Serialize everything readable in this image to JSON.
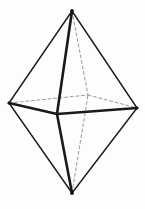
{
  "figure": {
    "kind": "line-drawing",
    "background_color": "#fdfdfc",
    "visible_edge_color": "#1a1a1a",
    "hidden_edge_color": "#9a9a9a",
    "canvas": {
      "width": 145,
      "height": 209
    },
    "vertices": [
      {
        "id": "top-apex",
        "label": "top apex",
        "x": 72,
        "y": 11,
        "hidden": false
      },
      {
        "id": "bottom-apex",
        "label": "bottom apex",
        "x": 72,
        "y": 193,
        "hidden": false
      },
      {
        "id": "left",
        "label": "left equator vertex",
        "x": 9,
        "y": 103,
        "hidden": false
      },
      {
        "id": "right",
        "label": "right equator vertex",
        "x": 137,
        "y": 108,
        "hidden": false
      },
      {
        "id": "front",
        "label": "front equator vertex",
        "x": 57,
        "y": 114,
        "hidden": false
      },
      {
        "id": "back",
        "label": "back equator vertex",
        "x": 88,
        "y": 95,
        "hidden": true
      }
    ],
    "edges": [
      {
        "id": "top-left",
        "from": "top-apex",
        "to": "left",
        "style": "solid",
        "weight": 1.4
      },
      {
        "id": "top-right",
        "from": "top-apex",
        "to": "right",
        "style": "solid",
        "weight": 1.4
      },
      {
        "id": "top-front",
        "from": "top-apex",
        "to": "front",
        "style": "solid",
        "weight": 2.6
      },
      {
        "id": "top-back",
        "from": "top-apex",
        "to": "back",
        "style": "dashed",
        "weight": 1.0
      },
      {
        "id": "bottom-left",
        "from": "bottom-apex",
        "to": "left",
        "style": "solid",
        "weight": 1.4
      },
      {
        "id": "bottom-right",
        "from": "bottom-apex",
        "to": "right",
        "style": "solid",
        "weight": 1.4
      },
      {
        "id": "bottom-front",
        "from": "bottom-apex",
        "to": "front",
        "style": "solid",
        "weight": 2.6
      },
      {
        "id": "bottom-back",
        "from": "bottom-apex",
        "to": "back",
        "style": "dashed",
        "weight": 1.0
      },
      {
        "id": "equator-left-front",
        "from": "left",
        "to": "front",
        "style": "solid",
        "weight": 2.4
      },
      {
        "id": "equator-front-right",
        "from": "front",
        "to": "right",
        "style": "solid",
        "weight": 2.4
      },
      {
        "id": "equator-left-back",
        "from": "left",
        "to": "back",
        "style": "dashed",
        "weight": 1.0
      },
      {
        "id": "equator-back-right",
        "from": "back",
        "to": "right",
        "style": "dashed",
        "weight": 1.0
      }
    ],
    "vertex_markers": [
      {
        "id": "marker-top-apex",
        "x": 72,
        "y": 11,
        "r": 1.9
      },
      {
        "id": "marker-bottom-apex",
        "x": 72,
        "y": 193,
        "r": 1.9
      },
      {
        "id": "marker-left",
        "x": 9,
        "y": 103,
        "r": 1.6
      },
      {
        "id": "marker-right",
        "x": 137,
        "y": 108,
        "r": 1.6
      }
    ],
    "dash_pattern": "3 2.6"
  }
}
